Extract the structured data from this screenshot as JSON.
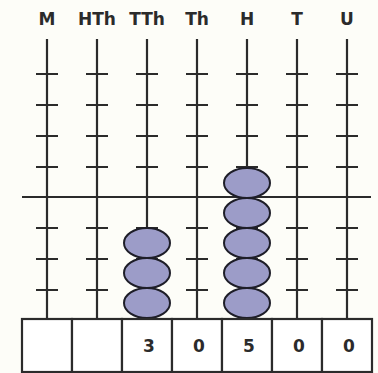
{
  "diagram": {
    "type": "abacus",
    "columns": [
      {
        "label": "M",
        "beads": 0,
        "digit": ""
      },
      {
        "label": "HTh",
        "beads": 0,
        "digit": ""
      },
      {
        "label": "TTh",
        "beads": 3,
        "digit": "3"
      },
      {
        "label": "Th",
        "beads": 0,
        "digit": "0"
      },
      {
        "label": "H",
        "beads": 5,
        "digit": "5"
      },
      {
        "label": "T",
        "beads": 0,
        "digit": "0"
      },
      {
        "label": "U",
        "beads": 0,
        "digit": "0"
      }
    ],
    "value": "30500",
    "colors": {
      "background": "#fdfdf8",
      "line": "#2b2b2b",
      "bead_fill": "#9c9cc8",
      "bead_stroke": "#1e1e28",
      "box_fill": "#ffffff"
    }
  }
}
